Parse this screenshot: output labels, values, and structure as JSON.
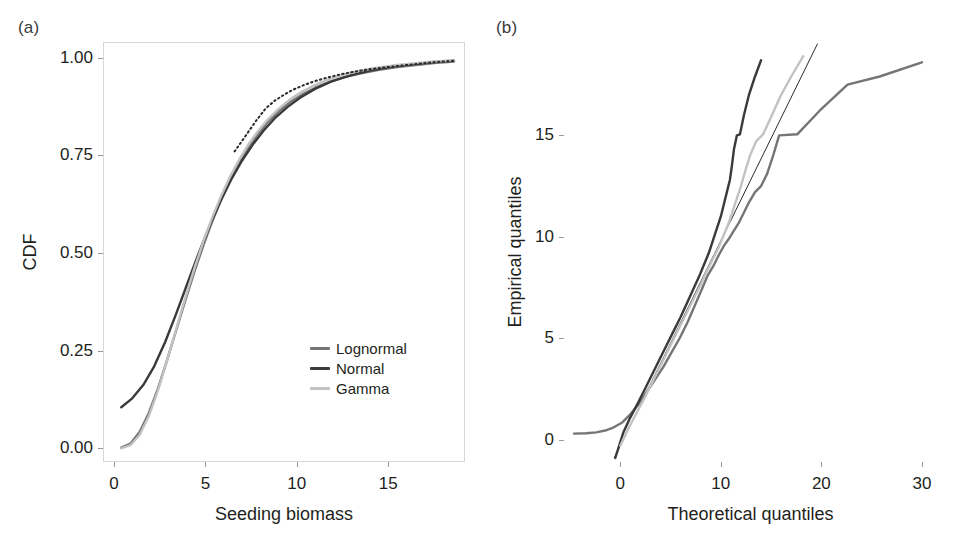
{
  "figure": {
    "panels": [
      {
        "tag": "(a)",
        "xlabel": "Seeding biomass",
        "ylabel": "CDF",
        "xticks": [
          "0",
          "5",
          "10",
          "15"
        ],
        "yticks": [
          "0.00",
          "0.25",
          "0.50",
          "0.75",
          "1.00"
        ]
      },
      {
        "tag": "(b)",
        "xlabel": "Theoretical quantiles",
        "ylabel": "Empirical quantiles",
        "xticks": [
          "0",
          "10",
          "20",
          "30"
        ],
        "yticks": [
          "0",
          "5",
          "10",
          "15"
        ]
      }
    ],
    "legend": {
      "items": [
        {
          "label": "Lognormal",
          "color": "#757575"
        },
        {
          "label": "Normal",
          "color": "#3a3a3a"
        },
        {
          "label": "Gamma",
          "color": "#c2c2c2"
        }
      ]
    }
  },
  "chart_data": [
    {
      "type": "line",
      "panel": "(a)",
      "title": "",
      "xlabel": "Seeding biomass",
      "ylabel": "CDF",
      "xlim": [
        -0.6,
        19.2
      ],
      "ylim": [
        -0.035,
        1.04
      ],
      "xticks": [
        0,
        5,
        10,
        15
      ],
      "yticks": [
        0.0,
        0.25,
        0.5,
        0.75,
        1.0
      ],
      "grid": false,
      "legend_position": "inside-lower-right",
      "series": [
        {
          "name": "Lognormal",
          "color": "#757575",
          "x": [
            0.4,
            0.9,
            1.4,
            1.9,
            2.4,
            2.9,
            3.4,
            3.9,
            4.4,
            4.9,
            5.4,
            5.9,
            6.4,
            6.9,
            7.4,
            7.9,
            8.4,
            9.0,
            9.6,
            10.3,
            11.0,
            11.8,
            12.6,
            13.5,
            14.5,
            15.5,
            16.5,
            17.5,
            18.6
          ],
          "y": [
            0.002,
            0.012,
            0.042,
            0.09,
            0.152,
            0.225,
            0.302,
            0.378,
            0.452,
            0.521,
            0.584,
            0.641,
            0.691,
            0.735,
            0.773,
            0.806,
            0.834,
            0.862,
            0.885,
            0.906,
            0.923,
            0.938,
            0.95,
            0.96,
            0.969,
            0.976,
            0.981,
            0.986,
            0.99
          ]
        },
        {
          "name": "Normal",
          "color": "#3a3a3a",
          "x": [
            0.4,
            1.0,
            1.6,
            2.2,
            2.8,
            3.4,
            4.0,
            4.6,
            5.2,
            5.8,
            6.4,
            7.0,
            7.6,
            8.2,
            8.8,
            9.5,
            10.2,
            11.0,
            11.9,
            12.9,
            14.0,
            15.2,
            16.5,
            17.8,
            18.6
          ],
          "y": [
            0.105,
            0.128,
            0.162,
            0.21,
            0.272,
            0.344,
            0.42,
            0.495,
            0.566,
            0.63,
            0.687,
            0.736,
            0.778,
            0.814,
            0.845,
            0.874,
            0.898,
            0.92,
            0.939,
            0.954,
            0.967,
            0.977,
            0.984,
            0.99,
            0.992
          ]
        },
        {
          "name": "Gamma",
          "color": "#c2c2c2",
          "x": [
            0.4,
            0.9,
            1.4,
            1.9,
            2.4,
            2.9,
            3.4,
            3.9,
            4.4,
            4.9,
            5.4,
            5.9,
            6.4,
            6.9,
            7.4,
            7.9,
            8.4,
            9.0,
            9.6,
            10.3,
            11.0,
            11.8,
            12.6,
            13.5,
            14.5,
            15.5,
            16.5,
            17.5,
            18.6
          ],
          "y": [
            0.0,
            0.008,
            0.034,
            0.082,
            0.147,
            0.224,
            0.305,
            0.385,
            0.461,
            0.531,
            0.594,
            0.65,
            0.7,
            0.743,
            0.781,
            0.813,
            0.841,
            0.869,
            0.892,
            0.913,
            0.93,
            0.945,
            0.957,
            0.967,
            0.975,
            0.981,
            0.986,
            0.99,
            0.993
          ]
        },
        {
          "name": "Empirical ECDF",
          "color": "#2a2a2a",
          "style": "dotted",
          "x": [
            6.6,
            7.2,
            7.8,
            8.3,
            8.8,
            9.3,
            9.8,
            10.4,
            11.0,
            11.6,
            12.2,
            12.8,
            13.4,
            14.1,
            14.8,
            15.6,
            16.4,
            17.2,
            18.0,
            18.6
          ],
          "y": [
            0.76,
            0.8,
            0.84,
            0.87,
            0.89,
            0.905,
            0.918,
            0.93,
            0.94,
            0.948,
            0.955,
            0.961,
            0.966,
            0.971,
            0.975,
            0.979,
            0.983,
            0.987,
            0.99,
            0.992
          ]
        }
      ]
    },
    {
      "type": "line",
      "panel": "(b)",
      "title": "",
      "xlabel": "Theoretical quantiles",
      "ylabel": "Empirical quantiles",
      "xlim": [
        -5.6,
        31.5
      ],
      "ylim": [
        -1.1,
        19.6
      ],
      "xticks": [
        0,
        10,
        20,
        30
      ],
      "yticks": [
        0,
        5,
        10,
        15
      ],
      "grid": false,
      "legend_position": "none",
      "series": [
        {
          "name": "Reference line",
          "color": "#2a2a2a",
          "width": 1,
          "x": [
            -0.6,
            19.6
          ],
          "y": [
            -0.9,
            19.5
          ]
        },
        {
          "name": "Lognormal",
          "color": "#757575",
          "x": [
            -4.6,
            -3.4,
            -2.4,
            -1.5,
            -0.7,
            0.2,
            1.0,
            1.9,
            2.7,
            3.5,
            4.3,
            5.1,
            5.9,
            6.7,
            7.4,
            8.1,
            8.7,
            9.3,
            9.8,
            10.3,
            10.8,
            11.3,
            11.8,
            12.3,
            12.8,
            13.4,
            14.0,
            14.6,
            15.2,
            15.8,
            17.6,
            19.8,
            22.6,
            25.8,
            30.0
          ],
          "y": [
            0.3,
            0.32,
            0.36,
            0.45,
            0.6,
            0.85,
            1.25,
            1.8,
            2.4,
            3.0,
            3.6,
            4.3,
            5.0,
            5.8,
            6.6,
            7.4,
            8.1,
            8.6,
            9.1,
            9.55,
            9.9,
            10.3,
            10.7,
            11.2,
            11.7,
            12.2,
            12.5,
            13.1,
            14.0,
            15.0,
            15.05,
            16.2,
            17.5,
            17.9,
            18.6
          ]
        },
        {
          "name": "Normal",
          "color": "#3a3a3a",
          "x": [
            -0.5,
            0.3,
            1.0,
            1.8,
            2.5,
            3.2,
            3.9,
            4.6,
            5.3,
            6.0,
            6.6,
            7.2,
            7.8,
            8.3,
            8.8,
            9.2,
            9.6,
            10.0,
            10.3,
            10.6,
            10.9,
            11.1,
            11.3,
            11.6,
            11.9,
            12.3,
            12.8,
            13.4,
            14.0
          ],
          "y": [
            -0.9,
            0.35,
            1.1,
            1.85,
            2.55,
            3.25,
            3.95,
            4.65,
            5.35,
            6.05,
            6.7,
            7.35,
            8.0,
            8.6,
            9.2,
            9.8,
            10.4,
            11.0,
            11.6,
            12.2,
            12.8,
            13.5,
            14.3,
            15.0,
            15.05,
            16.0,
            17.0,
            17.9,
            18.7
          ]
        },
        {
          "name": "Gamma",
          "color": "#c2c2c2",
          "x": [
            0.0,
            0.8,
            1.6,
            2.4,
            3.1,
            3.8,
            4.5,
            5.2,
            5.9,
            6.6,
            7.3,
            8.0,
            8.6,
            9.2,
            9.8,
            10.3,
            10.8,
            11.2,
            11.6,
            12.0,
            12.4,
            12.9,
            13.5,
            14.2,
            15.0,
            15.9,
            17.0,
            18.2
          ],
          "y": [
            -0.3,
            0.55,
            1.3,
            2.05,
            2.75,
            3.45,
            4.15,
            4.85,
            5.55,
            6.25,
            6.95,
            7.65,
            8.3,
            8.9,
            9.5,
            10.1,
            10.7,
            11.3,
            11.9,
            12.5,
            13.2,
            14.0,
            14.7,
            15.05,
            15.9,
            16.9,
            17.9,
            18.9
          ]
        }
      ]
    }
  ]
}
